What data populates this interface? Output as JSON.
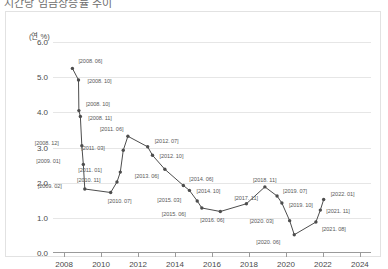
{
  "document": {
    "title_clipped": "시간당 임금상승률 추이"
  },
  "chart_data": {
    "type": "line",
    "title": "",
    "xlabel": "",
    "ylabel": "",
    "unit_label": "(연 %)",
    "xlim": [
      2007.4,
      2024.6
    ],
    "ylim": [
      0.0,
      6.0
    ],
    "grid": true,
    "legend": "none",
    "yticks": [
      "0.0",
      "1.0",
      "2.0",
      "3.0",
      "4.0",
      "5.0",
      "6.0"
    ],
    "ytick_values": [
      0.0,
      1.0,
      2.0,
      3.0,
      4.0,
      5.0,
      6.0
    ],
    "xticks": [
      "2008",
      "2010",
      "2012",
      "2014",
      "2016",
      "2018",
      "2020",
      "2022",
      "2024"
    ],
    "xtick_values": [
      2008,
      2010,
      2012,
      2014,
      2016,
      2018,
      2020,
      2022,
      2024
    ],
    "series": [
      {
        "name": "시간당 임금상승률",
        "color": "#4d4d4d",
        "points": [
          {
            "label": "[2008. 06]",
            "x": 2008.45,
            "y": 5.25,
            "lx": 6,
            "ly": -9
          },
          {
            "label": "[2008. 10]",
            "x": 2008.78,
            "y": 4.92,
            "lx": 9,
            "ly": -1
          },
          {
            "label": "[2008. 10]",
            "x": 2008.8,
            "y": 4.05,
            "lx": 7,
            "ly": -9
          },
          {
            "label": "[2008. 11]",
            "x": 2008.88,
            "y": 3.88,
            "lx": 8,
            "ly": -1
          },
          {
            "label": "[2008. 12]",
            "x": 2008.96,
            "y": 3.05,
            "lx": -47,
            "ly": -5
          },
          {
            "label": "[2009. 01]",
            "x": 2009.04,
            "y": 2.52,
            "lx": -47,
            "ly": -5
          },
          {
            "label": "[2009. 02]",
            "x": 2009.12,
            "y": 1.82,
            "lx": -47,
            "ly": -5
          },
          {
            "label": "[2010. 07]",
            "x": 2010.52,
            "y": 1.72,
            "lx": -3,
            "ly": 6
          },
          {
            "label": "[2010. 11]",
            "x": 2010.86,
            "y": 2.02,
            "lx": -40,
            "ly": -4
          },
          {
            "label": "[2011. 01]",
            "x": 2011.04,
            "y": 2.3,
            "lx": -42,
            "ly": -4
          },
          {
            "label": "[2011. 03]",
            "x": 2011.2,
            "y": 2.92,
            "lx": -42,
            "ly": -4
          },
          {
            "label": "[2011. 06]",
            "x": 2011.45,
            "y": 3.32,
            "lx": -28,
            "ly": -9
          },
          {
            "label": "[2012. 07]",
            "x": 2012.52,
            "y": 3.02,
            "lx": 7,
            "ly": -8
          },
          {
            "label": "[2012. 10]",
            "x": 2012.78,
            "y": 2.78,
            "lx": 7,
            "ly": -1
          },
          {
            "label": "[2013. 06]",
            "x": 2013.45,
            "y": 2.38,
            "lx": -30,
            "ly": 5
          },
          {
            "label": "[2014. 06]",
            "x": 2014.45,
            "y": 1.92,
            "lx": 6,
            "ly": -8
          },
          {
            "label": "[2014. 10]",
            "x": 2014.78,
            "y": 1.78,
            "lx": 7,
            "ly": -1
          },
          {
            "label": "[2015. 03]",
            "x": 2015.2,
            "y": 1.48,
            "lx": -40,
            "ly": -3
          },
          {
            "label": "[2015. 06]",
            "x": 2015.45,
            "y": 1.28,
            "lx": -40,
            "ly": 4
          },
          {
            "label": "[2016. 06]",
            "x": 2016.45,
            "y": 1.18,
            "lx": -20,
            "ly": 6
          },
          {
            "label": "[2017. 11]",
            "x": 2017.86,
            "y": 1.4,
            "lx": -12,
            "ly": -8
          },
          {
            "label": "[2018. 11]",
            "x": 2018.86,
            "y": 1.88,
            "lx": -12,
            "ly": -9
          },
          {
            "label": "[2019. 07]",
            "x": 2019.52,
            "y": 1.62,
            "lx": 6,
            "ly": -7
          },
          {
            "label": "[2019. 10]",
            "x": 2019.78,
            "y": 1.42,
            "lx": 7,
            "ly": 0
          },
          {
            "label": "[2020. 03]",
            "x": 2020.2,
            "y": 0.92,
            "lx": -40,
            "ly": -2
          },
          {
            "label": "[2020. 06]",
            "x": 2020.45,
            "y": 0.52,
            "lx": -38,
            "ly": 5
          },
          {
            "label": "[2021. 08]",
            "x": 2021.62,
            "y": 0.88,
            "lx": 6,
            "ly": 5
          },
          {
            "label": "[2021. 11]",
            "x": 2021.86,
            "y": 1.22,
            "lx": 6,
            "ly": -1
          },
          {
            "label": "[2022. 01]",
            "x": 2022.04,
            "y": 1.52,
            "lx": 7,
            "ly": -8
          }
        ]
      }
    ]
  }
}
